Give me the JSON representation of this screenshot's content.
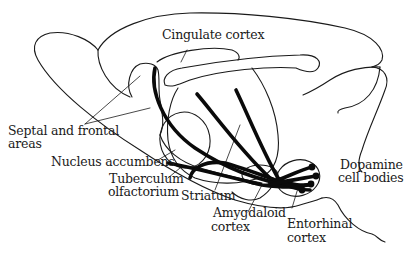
{
  "diagram": {
    "labels": {
      "cingulate": "Cingulate cortex",
      "septal_line1": "Septal and frontal",
      "septal_line2": "areas",
      "accumbens": "Nucleus accumbens",
      "tuberculum_line1": "Tuberculum",
      "tuberculum_line2": "olfactorium",
      "striatum": "Striatum",
      "amygdaloid_line1": "Amygdaloid",
      "amygdaloid_line2": "cortex",
      "entorhinal_line1": "Entorhinal",
      "entorhinal_line2": "cortex",
      "dopamine_line1": "Dopamine",
      "dopamine_line2": "cell bodies"
    },
    "colors": {
      "ink": "#1a1a1a",
      "fiber": "#0a0a0a",
      "background": "#ffffff"
    }
  }
}
